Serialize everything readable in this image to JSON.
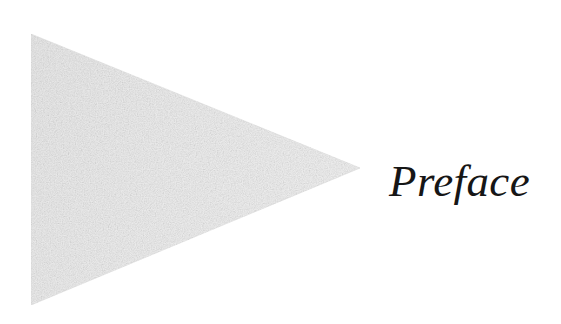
{
  "page": {
    "width": 561,
    "height": 324,
    "background_color": "#ffffff",
    "kind": "book-chapter-opening-page"
  },
  "heading": {
    "text": "Preface",
    "color": "#161616",
    "style": "italic-serif-didone",
    "font_size_px": 45
  },
  "ornament": {
    "name": "right-pointing-triangle-wedge",
    "fill_color": "#ececec",
    "edge_color": "#e4e4e4",
    "texture": "halftone-paper-grain",
    "points": [
      {
        "x": 31,
        "y": 34
      },
      {
        "x": 360,
        "y": 168
      },
      {
        "x": 31,
        "y": 305
      }
    ]
  }
}
